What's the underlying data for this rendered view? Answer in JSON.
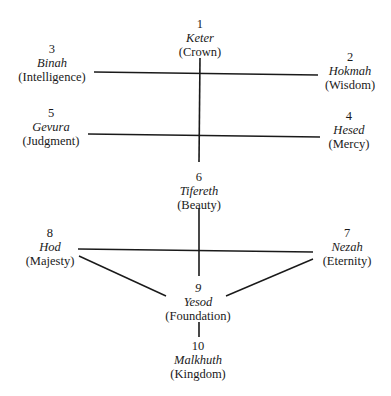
{
  "diagram": {
    "type": "sefirot tree",
    "nodes": [
      {
        "id": "keter",
        "number": "1",
        "hebrew": "Keter",
        "english": "(Crown)"
      },
      {
        "id": "hokmah",
        "number": "2",
        "hebrew": "Hokmah",
        "english": "(Wisdom)"
      },
      {
        "id": "binah",
        "number": "3",
        "hebrew": "Binah",
        "english": "(Intelligence)"
      },
      {
        "id": "hesed",
        "number": "4",
        "hebrew": "Hesed",
        "english": "(Mercy)"
      },
      {
        "id": "gevura",
        "number": "5",
        "hebrew": "Gevura",
        "english": "(Judgment)"
      },
      {
        "id": "tifereth",
        "number": "6",
        "hebrew": "Tifereth",
        "english": "(Beauty)"
      },
      {
        "id": "nezah",
        "number": "7",
        "hebrew": "Nezah",
        "english": "(Eternity)"
      },
      {
        "id": "hod",
        "number": "8",
        "hebrew": "Hod",
        "english": "(Majesty)"
      },
      {
        "id": "yesod",
        "number": "9",
        "hebrew": "Yesod",
        "english": "(Foundation)"
      },
      {
        "id": "malkhuth",
        "number": "10",
        "hebrew": "Malkhuth",
        "english": "(Kingdom)"
      }
    ],
    "edges": [
      {
        "from": "keter",
        "to": "tifereth"
      },
      {
        "from": "binah",
        "to": "hokmah"
      },
      {
        "from": "gevura",
        "to": "hesed"
      },
      {
        "from": "tifereth",
        "to": "yesod"
      },
      {
        "from": "hod",
        "to": "nezah"
      },
      {
        "from": "hod",
        "to": "yesod"
      },
      {
        "from": "nezah",
        "to": "yesod"
      },
      {
        "from": "yesod",
        "to": "malkhuth"
      }
    ],
    "line_color": "#1a1a1a"
  }
}
